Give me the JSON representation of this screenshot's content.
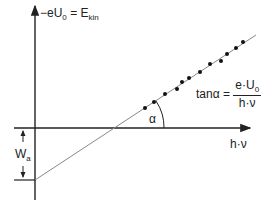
{
  "diagram": {
    "y_axis_label": {
      "prefix": "−eU",
      "sub": "0",
      "eq": " = E",
      "sub2": "kin"
    },
    "x_axis_label": "h·ν",
    "angle_label": "α",
    "work_function_label": {
      "main": "W",
      "sub": "a"
    },
    "slope_formula": {
      "lhs": "tanα = ",
      "numerator_main": "e·U",
      "numerator_sub": "0",
      "denominator": "h·ν"
    },
    "colors": {
      "axis": "#222222",
      "fit_line": "#888888",
      "dots": "#111111"
    }
  }
}
